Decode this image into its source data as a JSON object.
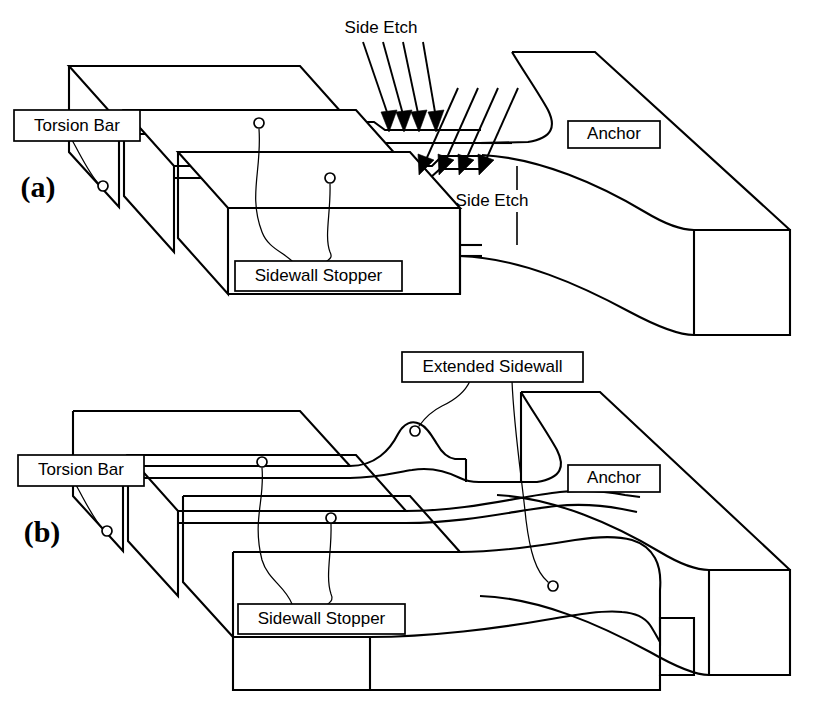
{
  "figure": {
    "background_color": "#ffffff",
    "line_color": "#000000",
    "width": 813,
    "height": 703
  },
  "panels": [
    {
      "id": "a",
      "tag": "(a)",
      "description": "Conventional sidewall stopper showing side etch undercut",
      "labels": [
        {
          "name": "torsion-bar",
          "text": "Torsion Bar",
          "boxed": true
        },
        {
          "name": "sidewall-stopper",
          "text": "Sidewall Stopper",
          "boxed": true
        },
        {
          "name": "anchor",
          "text": "Anchor",
          "boxed": true
        },
        {
          "name": "side-etch-top",
          "text": "Side Etch",
          "boxed": false
        },
        {
          "name": "side-etch-bottom",
          "text": "Side Etch",
          "boxed": false
        }
      ],
      "arrow_groups": [
        {
          "name": "side-etch-arrows-upper",
          "count": 4
        },
        {
          "name": "side-etch-arrows-lower",
          "count": 4
        }
      ]
    },
    {
      "id": "b",
      "tag": "(b)",
      "description": "Improved design with extended sidewall preventing side etch",
      "labels": [
        {
          "name": "torsion-bar",
          "text": "Torsion Bar",
          "boxed": true
        },
        {
          "name": "sidewall-stopper",
          "text": "Sidewall Stopper",
          "boxed": true
        },
        {
          "name": "anchor",
          "text": "Anchor",
          "boxed": true
        },
        {
          "name": "extended-sidewall",
          "text": "Extended Sidewall",
          "boxed": true
        }
      ],
      "arrow_groups": []
    }
  ],
  "label_text": {
    "torsion_bar": "Torsion Bar",
    "sidewall_stopper": "Sidewall Stopper",
    "anchor": "Anchor",
    "side_etch": "Side Etch",
    "extended_sidewall": "Extended Sidewall",
    "panel_a_tag": "(a)",
    "panel_b_tag": "(b)"
  }
}
